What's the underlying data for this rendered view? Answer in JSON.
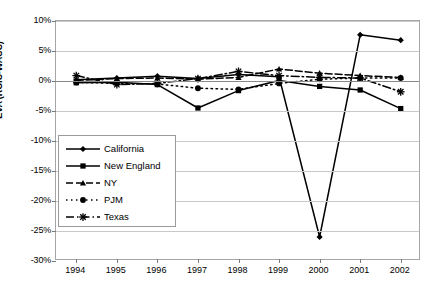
{
  "chart_data": {
    "type": "line",
    "title": "",
    "xlabel": "",
    "ylabel": "EVA (ROIC-WACC)",
    "categories": [
      "1994",
      "1995",
      "1996",
      "1997",
      "1998",
      "1999",
      "2000",
      "2001",
      "2002"
    ],
    "ylim": [
      -30,
      10
    ],
    "ytick_labels": [
      "10%",
      "5%",
      "0%",
      "-5%",
      "-10%",
      "-15%",
      "-20%",
      "-25%",
      "-30%"
    ],
    "ytick_values": [
      10,
      5,
      0,
      -5,
      -10,
      -15,
      -20,
      -25,
      -30
    ],
    "grid": true,
    "legend_position": "inside-lower-left",
    "series": [
      {
        "name": "California",
        "marker": "diamond",
        "style": "solid",
        "color": "#000000",
        "values": [
          0.2,
          0.5,
          0.8,
          0.4,
          1.1,
          0.7,
          -26.0,
          7.7,
          6.8
        ]
      },
      {
        "name": "New England",
        "marker": "square",
        "style": "solid",
        "color": "#000000",
        "values": [
          -0.3,
          -0.2,
          -0.6,
          -4.5,
          -1.6,
          0.1,
          -0.9,
          -1.5,
          -4.6
        ]
      },
      {
        "name": "NY",
        "marker": "triangle",
        "style": "dashed",
        "color": "#000000",
        "values": [
          0.1,
          0.4,
          0.5,
          0.3,
          0.6,
          2.0,
          1.3,
          0.9,
          0.6
        ]
      },
      {
        "name": "PJM",
        "marker": "circle",
        "style": "dotted",
        "color": "#000000",
        "values": [
          -0.2,
          -0.4,
          -0.5,
          -1.2,
          -1.4,
          -0.4,
          0.3,
          0.5,
          0.5
        ]
      },
      {
        "name": "Texas",
        "marker": "asterisk",
        "style": "dashdot",
        "color": "#000000",
        "values": [
          0.9,
          -0.6,
          -0.4,
          0.4,
          1.6,
          0.9,
          0.6,
          0.5,
          -1.8
        ]
      }
    ]
  },
  "axis": {
    "y_title": "EVA (ROIC-WACC)"
  },
  "legend": {
    "items": [
      {
        "label": "California"
      },
      {
        "label": "New England"
      },
      {
        "label": "NY"
      },
      {
        "label": "PJM"
      },
      {
        "label": "Texas"
      }
    ]
  }
}
